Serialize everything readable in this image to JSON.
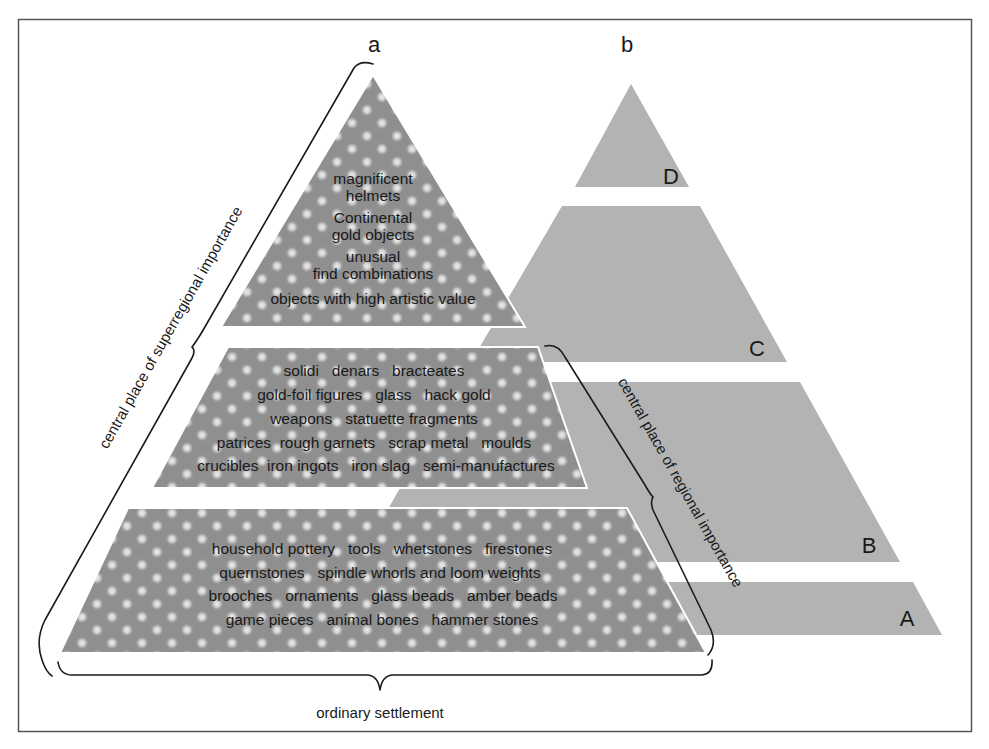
{
  "figure": {
    "pyramid_a": {
      "label": "a",
      "tiers": [
        {
          "name": "top",
          "lines": [
            "magnificent",
            "helmets",
            "Continental",
            "gold objects",
            "unusual",
            "find combinations",
            "objects with high artistic value"
          ]
        },
        {
          "name": "middle",
          "lines": [
            "solidi   denars   bracteates",
            "gold-foil figures   glass   hack gold",
            "weapons   statuette fragments",
            "patrices  rough garnets   scrap metal   moulds",
            "crucibles  iron ingots   iron slag   semi-manufactures"
          ]
        },
        {
          "name": "bottom",
          "lines": [
            "household pottery   tools   whetstones   firestones",
            "quernstones   spindle whorls and loom weights",
            "brooches   ornaments   glass beads   amber beads",
            "game pieces   animal bones   hammer stones"
          ]
        }
      ]
    },
    "pyramid_b": {
      "label": "b",
      "tiers": [
        "D",
        "C",
        "B",
        "A"
      ]
    },
    "braces": {
      "left": "central place of superregional importance",
      "right": "central place of regional importance",
      "bottom": "ordinary settlement"
    },
    "colors": {
      "pyramid_b_fill": "#b3b3b3",
      "pyramid_a_base": "#8f8f8f",
      "pyramid_a_dots": "#e2e2e2",
      "frame": "#555555",
      "text": "#1a1a1a"
    }
  }
}
